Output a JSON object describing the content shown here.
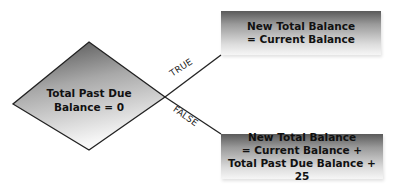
{
  "decision": {
    "line1": "Total Past Due",
    "line2": "Balance = 0"
  },
  "branches": {
    "true_label": "TRUE",
    "false_label": "FALSE"
  },
  "true_result": {
    "line1": "New Total Balance",
    "line2": "= Current Balance"
  },
  "false_result": {
    "line1": "New Total Balance",
    "line2": "= Current Balance +",
    "line3": "Total Past Due Balance + 25"
  },
  "colors": {
    "line": "#222222",
    "gradient_dark": "#5a5a5a",
    "gradient_light": "#f6f6f6"
  }
}
